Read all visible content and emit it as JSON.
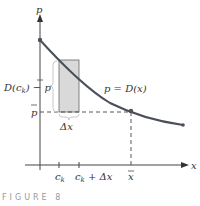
{
  "figure": {
    "caption": "FIGURE 8",
    "curve_label": "p = D(x)",
    "axis_labels": {
      "y": "p",
      "x": "x"
    },
    "labels": {
      "height": "D(c",
      "height_sub": "k",
      "height_rest": ") − p",
      "pbar": "p",
      "delta_x": "Δx",
      "ck": "c",
      "ck_sub": "k",
      "ck_dx": "c",
      "ck_dx_sub": "k",
      "ck_dx_rest": " + Δx",
      "xbar": "x"
    },
    "colors": {
      "curve": "#4a4f5a",
      "rect_fill": "#d9d9d9",
      "rect_stroke": "#555555",
      "brace": "#c8c8c8",
      "axes": "#444444"
    }
  }
}
